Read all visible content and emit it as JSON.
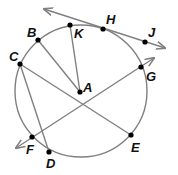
{
  "diagram": {
    "type": "circle-geometry",
    "colors": {
      "line": "#808080",
      "point": "#000000",
      "label": "#111111",
      "background": "#ffffff"
    },
    "circle": {
      "center": "A",
      "cx": 81,
      "cy": 91,
      "r": 66
    },
    "points": [
      {
        "name": "A",
        "x": 80,
        "y": 92,
        "lx": 83,
        "ly": 92
      },
      {
        "name": "B",
        "x": 38,
        "y": 40,
        "lx": 27,
        "ly": 37
      },
      {
        "name": "K",
        "x": 70,
        "y": 25,
        "lx": 74,
        "ly": 38
      },
      {
        "name": "C",
        "x": 20,
        "y": 64,
        "lx": 9,
        "ly": 61
      },
      {
        "name": "H",
        "x": 103,
        "y": 29,
        "lx": 106,
        "ly": 24
      },
      {
        "name": "J",
        "x": 145,
        "y": 42,
        "lx": 148,
        "ly": 37
      },
      {
        "name": "G",
        "x": 141,
        "y": 67,
        "lx": 146,
        "ly": 81
      },
      {
        "name": "F",
        "x": 32,
        "y": 137,
        "lx": 26,
        "ly": 154
      },
      {
        "name": "D",
        "x": 49,
        "y": 152,
        "lx": 46,
        "ly": 168
      },
      {
        "name": "E",
        "x": 131,
        "y": 135,
        "lx": 131,
        "ly": 152
      }
    ],
    "lines": [
      {
        "name": "tangent-line-HJ",
        "kind": "line",
        "x1": 44,
        "y1": 9,
        "x2": 165,
        "y2": 48
      },
      {
        "name": "secant-line-FG",
        "kind": "line",
        "x1": 16,
        "y1": 148,
        "x2": 154,
        "y2": 58
      }
    ],
    "segments": [
      {
        "name": "chord-CD",
        "from": "C",
        "to": "D"
      },
      {
        "name": "chord-CE",
        "from": "C",
        "to": "E"
      },
      {
        "name": "radius-AB",
        "from": "A",
        "to": "B"
      },
      {
        "name": "radius-AK",
        "from": "A",
        "to": "K"
      }
    ],
    "labels": {
      "A": "A",
      "B": "B",
      "C": "C",
      "D": "D",
      "E": "E",
      "F": "F",
      "G": "G",
      "H": "H",
      "J": "J",
      "K": "K"
    }
  }
}
